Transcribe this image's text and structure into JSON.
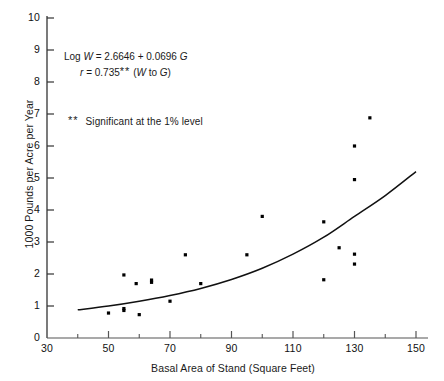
{
  "chart_data": {
    "type": "scatter",
    "title": "",
    "xlabel": "Basal Area of Stand (Square Feet)",
    "ylabel": "1000 Pounds per Acre per Year",
    "xlim": [
      30,
      150
    ],
    "ylim": [
      0,
      10
    ],
    "xticks": [
      30,
      50,
      70,
      90,
      110,
      130,
      150
    ],
    "xtick_labels": [
      "30",
      "50",
      "70",
      "90",
      "110",
      "130",
      "150"
    ],
    "xminor_ticks": [
      40,
      60,
      80,
      100,
      120,
      140
    ],
    "yticks": [
      0,
      1,
      2,
      3,
      4,
      5,
      6,
      7,
      8,
      9,
      10
    ],
    "ytick_labels": [
      "0",
      "1",
      "2",
      "3",
      "4",
      "5",
      "6",
      "7",
      "8",
      "9",
      "10"
    ],
    "grid": false,
    "legend": false,
    "marker": "square",
    "marker_color": "#000000",
    "line_color": "#000000",
    "points": [
      {
        "x": 50,
        "y": 0.78
      },
      {
        "x": 55,
        "y": 1.97
      },
      {
        "x": 55,
        "y": 0.92
      },
      {
        "x": 55,
        "y": 0.86
      },
      {
        "x": 59,
        "y": 1.7
      },
      {
        "x": 60,
        "y": 0.73
      },
      {
        "x": 64,
        "y": 1.81
      },
      {
        "x": 64,
        "y": 1.74
      },
      {
        "x": 70,
        "y": 1.15
      },
      {
        "x": 75,
        "y": 2.6
      },
      {
        "x": 80,
        "y": 1.7
      },
      {
        "x": 95,
        "y": 2.6
      },
      {
        "x": 100,
        "y": 3.8
      },
      {
        "x": 120,
        "y": 1.82
      },
      {
        "x": 120,
        "y": 3.63
      },
      {
        "x": 125,
        "y": 2.82
      },
      {
        "x": 130,
        "y": 2.62
      },
      {
        "x": 130,
        "y": 2.31
      },
      {
        "x": 130,
        "y": 4.95
      },
      {
        "x": 130,
        "y": 6.0
      },
      {
        "x": 135,
        "y": 6.88
      }
    ],
    "fit_curve": {
      "equation_form": "log10(W) = 2.6646 + 0.0696 * G_scaled",
      "x_range": [
        40,
        150
      ],
      "points": [
        {
          "x": 40,
          "y": 0.88
        },
        {
          "x": 50,
          "y": 1.0
        },
        {
          "x": 60,
          "y": 1.15
        },
        {
          "x": 70,
          "y": 1.33
        },
        {
          "x": 80,
          "y": 1.55
        },
        {
          "x": 90,
          "y": 1.83
        },
        {
          "x": 100,
          "y": 2.18
        },
        {
          "x": 110,
          "y": 2.62
        },
        {
          "x": 120,
          "y": 3.15
        },
        {
          "x": 130,
          "y": 3.8
        },
        {
          "x": 140,
          "y": 4.45
        },
        {
          "x": 150,
          "y": 5.2
        }
      ]
    },
    "annotations": {
      "equation_line1_prefix": "Log",
      "equation_line1_var": "W",
      "equation_line1_body": "=  2.6646 + 0.0696",
      "equation_line1_var2": "G",
      "equation_line2_var": "r",
      "equation_line2_body": "=  0.735",
      "equation_line2_stars": "**",
      "equation_line2_tail_open": "(",
      "equation_line2_tail_w": "W",
      "equation_line2_tail_mid": " to ",
      "equation_line2_tail_g": "G",
      "equation_line2_tail_close": ")",
      "significance_stars": "**",
      "significance_text": "Significant at the 1% level"
    }
  }
}
